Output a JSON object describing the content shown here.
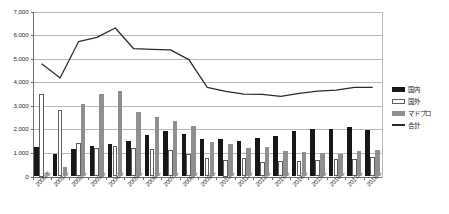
{
  "chart_data": {
    "type": "bar",
    "title": "",
    "xlabel": "",
    "ylabel": "",
    "ylim": [
      0,
      7000
    ],
    "ytick_step": 1000,
    "grid": true,
    "legend_position": "right",
    "categories": [
      "2000年",
      "2001年",
      "2002年",
      "2003年",
      "2004年",
      "2005年",
      "2006年",
      "2007年",
      "2008年",
      "2009年",
      "2010年",
      "2011年",
      "2012年",
      "2013年",
      "2014年",
      "2015年",
      "2016年",
      "2017年",
      "2018年"
    ],
    "ytick_labels": [
      "0",
      "1,000",
      "2,000",
      "3,000",
      "4,000",
      "5,000",
      "6,000",
      "7,000"
    ],
    "series": [
      {
        "name": "国内",
        "type": "bar",
        "color": "#171717",
        "values": [
          1250,
          950,
          1180,
          1290,
          1400,
          1520,
          1760,
          1930,
          1790,
          1600,
          1570,
          1510,
          1650,
          1730,
          1940,
          2030,
          2000,
          2090,
          1980
        ]
      },
      {
        "name": "国外",
        "type": "bar",
        "color": "#ffffff",
        "values": [
          3500,
          2830,
          1440,
          1230,
          1300,
          1190,
          1170,
          1140,
          960,
          790,
          700,
          780,
          610,
          670,
          650,
          690,
          760,
          740,
          830
        ]
      },
      {
        "name": "マドプロ",
        "type": "bar",
        "color": "#8f8f8f",
        "values": [
          null,
          420,
          3080,
          3500,
          3620,
          2750,
          2540,
          2370,
          2150,
          1460,
          1370,
          1220,
          1260,
          1080,
          1030,
          980,
          940,
          1080,
          1110
        ]
      },
      {
        "name": "合計",
        "type": "line",
        "color": "#2b2b2b",
        "values": [
          4780,
          4180,
          5720,
          5900,
          6300,
          5420,
          5390,
          5370,
          4960,
          3780,
          3610,
          3490,
          3480,
          3400,
          3530,
          3620,
          3660,
          3780,
          3780
        ]
      }
    ]
  },
  "legend": {
    "items": [
      {
        "label": "国内",
        "key": "swatch-filled-dark"
      },
      {
        "label": "国外",
        "key": "swatch-outlined-white"
      },
      {
        "label": "マドプロ",
        "key": "swatch-filled-gray"
      },
      {
        "label": "合計",
        "key": "line-dark"
      }
    ]
  }
}
